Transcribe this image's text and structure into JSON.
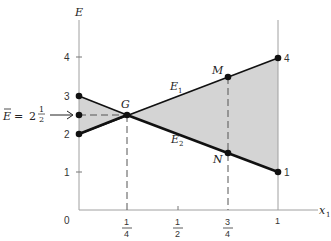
{
  "diagram": {
    "type": "line-region",
    "y_axis_label": "E",
    "x_axis_label": "x",
    "x_axis_subscript": "1",
    "origin_label": "0",
    "y_ticks": [
      {
        "value": 1,
        "label": "1"
      },
      {
        "value": 2,
        "label": "2"
      },
      {
        "value": 3,
        "label": "3"
      },
      {
        "value": 4,
        "label": "4"
      }
    ],
    "x_ticks": [
      {
        "value": 0.25,
        "num": "1",
        "den": "4"
      },
      {
        "value": 0.5,
        "num": "1",
        "den": "2"
      },
      {
        "value": 0.75,
        "num": "3",
        "den": "4"
      },
      {
        "value": 1,
        "label": "1"
      }
    ],
    "lines": [
      {
        "name": "E",
        "subscript": "1",
        "from": [
          0,
          2
        ],
        "to": [
          1,
          4
        ]
      },
      {
        "name": "E",
        "subscript": "2",
        "from": [
          0,
          3
        ],
        "to": [
          1,
          1
        ]
      }
    ],
    "points": [
      {
        "label": "G",
        "x": 0.25,
        "y": 2.5
      },
      {
        "label": "M",
        "x": 0.75,
        "y": 3.5
      },
      {
        "label": "N",
        "x": 0.75,
        "y": 1.5
      }
    ],
    "endpoint_labels": {
      "right_top": "4",
      "right_bottom": "1"
    },
    "annotation": {
      "lhs": "E",
      "equals": "=",
      "whole": "2",
      "num": "1",
      "den": "2"
    },
    "colors": {
      "shade": "#d4d4d4",
      "line": "#111111",
      "axis": "#9a9a9a"
    }
  }
}
